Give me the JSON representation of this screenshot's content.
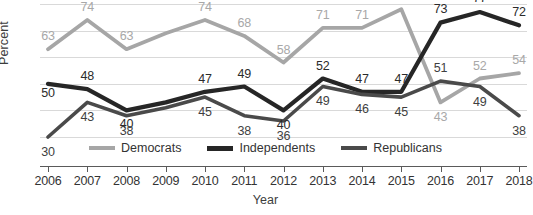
{
  "chart_data": {
    "type": "line",
    "title": "",
    "xlabel": "Year",
    "ylabel": "Percent",
    "ylim": [
      30,
      80
    ],
    "xlim": [
      2006,
      2018
    ],
    "grid": true,
    "legend_position": "bottom",
    "categories": [
      "2006",
      "2007",
      "2008",
      "2009",
      "2010",
      "2011",
      "2012",
      "2013",
      "2014",
      "2015",
      "2016",
      "2017",
      "2018"
    ],
    "x": [
      2006,
      2007,
      2008,
      2009,
      2010,
      2011,
      2012,
      2013,
      2014,
      2015,
      2016,
      2017,
      2018
    ],
    "series": [
      {
        "name": "Democrats",
        "color": "#a6a6a6",
        "values": [
          63,
          74,
          63,
          69,
          74,
          68,
          58,
          71,
          71,
          78,
          43,
          52,
          54
        ],
        "labels": [
          "63",
          "74",
          "63",
          "",
          "74",
          "68",
          "58",
          "71",
          "71",
          "78",
          "43",
          "52",
          "54"
        ]
      },
      {
        "name": "Independents",
        "color": "#262626",
        "values": [
          50,
          48,
          40,
          43,
          47,
          49,
          40,
          52,
          47,
          47,
          73,
          77,
          72
        ],
        "labels": [
          "50",
          "48",
          "40",
          "",
          "47",
          "49",
          "40",
          "52",
          "47",
          "47",
          "73",
          "77",
          "72"
        ]
      },
      {
        "name": "Republicans",
        "color": "#4a4a4a",
        "values": [
          30,
          43,
          38,
          41,
          45,
          38,
          36,
          49,
          46,
          45,
          51,
          49,
          38
        ],
        "labels": [
          "30",
          "43",
          "38",
          "",
          "45",
          "38",
          "36",
          "49",
          "46",
          "45",
          "51",
          "49",
          "38"
        ]
      }
    ],
    "gridline_values": [
      80,
      70,
      60,
      50,
      40,
      30
    ],
    "axis_line_color": "#5a5a5a",
    "gridline_color": "#d9d9d9"
  },
  "legend": {
    "items": [
      {
        "label": "Democrats",
        "color": "#a6a6a6"
      },
      {
        "label": "Independents",
        "color": "#262626"
      },
      {
        "label": "Republicans",
        "color": "#4a4a4a"
      }
    ]
  },
  "axes": {
    "y_title": "Percent",
    "x_title": "Year",
    "x_ticks": [
      "2006",
      "2007",
      "2008",
      "2009",
      "2010",
      "2011",
      "2012",
      "2013",
      "2014",
      "2015",
      "2016",
      "2017",
      "2018"
    ]
  }
}
